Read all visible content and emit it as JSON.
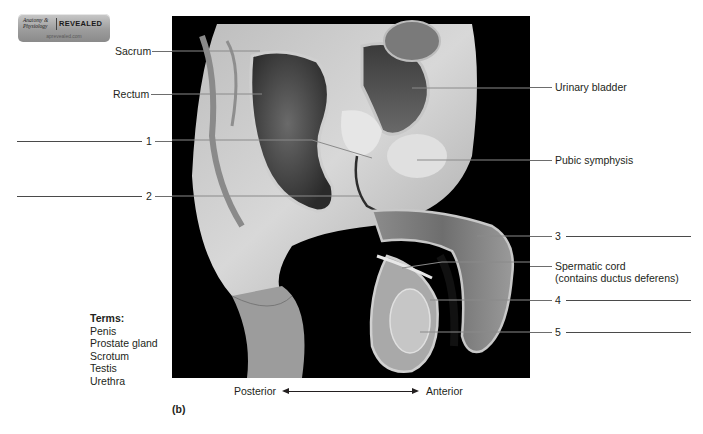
{
  "figure": {
    "title_fragment": "FIGURE 3.4 ...",
    "panel_label": "(b)"
  },
  "logo": {
    "line1": "Anatomy &",
    "line2": "Physiology",
    "brand": "REVEALED",
    "url": "aprevealed.com"
  },
  "labels": {
    "left": [
      {
        "id": "sacrum",
        "text": "Sacrum"
      },
      {
        "id": "rectum",
        "text": "Rectum"
      }
    ],
    "right": [
      {
        "id": "urinary-bladder",
        "text": "Urinary bladder"
      },
      {
        "id": "pubic-symphysis",
        "text": "Pubic symphysis"
      },
      {
        "id": "spermatic-cord",
        "text": "Spermatic cord",
        "subtext": "(contains ductus deferens)"
      }
    ],
    "numbered": [
      {
        "number": "1",
        "side": "left",
        "answer": ""
      },
      {
        "number": "2",
        "side": "left",
        "answer": ""
      },
      {
        "number": "3",
        "side": "right",
        "answer": ""
      },
      {
        "number": "4",
        "side": "right",
        "answer": ""
      },
      {
        "number": "5",
        "side": "right",
        "answer": ""
      }
    ]
  },
  "terms": {
    "heading": "Terms:",
    "items": [
      "Penis",
      "Prostate gland",
      "Scrotum",
      "Testis",
      "Urethra"
    ]
  },
  "orientation": {
    "left": "Posterior",
    "right": "Anterior"
  },
  "colors": {
    "text": "#231f20",
    "leader_line": "#6d6d6d",
    "photo_background": "#000000"
  }
}
